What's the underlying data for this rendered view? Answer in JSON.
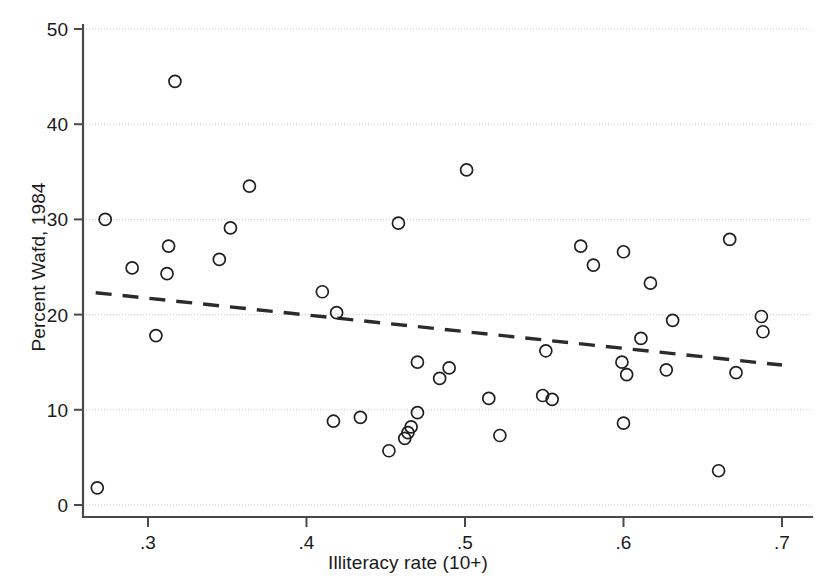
{
  "chart_data": {
    "type": "scatter",
    "title": "",
    "xlabel": "Illiteracy rate (10+)",
    "ylabel": "Percent Wafd, 1984",
    "xlim": [
      0.2595,
      0.7035
    ],
    "ylim": [
      0,
      50
    ],
    "xticks": [
      0.3,
      0.4,
      0.5,
      0.6,
      0.7
    ],
    "xticklabels": [
      ".3",
      ".4",
      ".5",
      ".6",
      ".7"
    ],
    "yticks": [
      0,
      10,
      20,
      30,
      40,
      50
    ],
    "yticklabels": [
      "0",
      "10",
      "20",
      "30",
      "40",
      "50"
    ],
    "grid": "horizontal-dotted",
    "legend": "none",
    "marker": "open-circle",
    "marker_color": "#1f1f1f",
    "marker_radius": 6,
    "points": [
      {
        "x": 0.268,
        "y": 1.8
      },
      {
        "x": 0.273,
        "y": 30.0
      },
      {
        "x": 0.29,
        "y": 24.9
      },
      {
        "x": 0.305,
        "y": 17.8
      },
      {
        "x": 0.312,
        "y": 24.3
      },
      {
        "x": 0.313,
        "y": 27.2
      },
      {
        "x": 0.317,
        "y": 44.5
      },
      {
        "x": 0.345,
        "y": 25.8
      },
      {
        "x": 0.352,
        "y": 29.1
      },
      {
        "x": 0.364,
        "y": 33.5
      },
      {
        "x": 0.41,
        "y": 22.4
      },
      {
        "x": 0.417,
        "y": 8.8
      },
      {
        "x": 0.419,
        "y": 20.2
      },
      {
        "x": 0.434,
        "y": 9.2
      },
      {
        "x": 0.452,
        "y": 5.7
      },
      {
        "x": 0.458,
        "y": 29.6
      },
      {
        "x": 0.462,
        "y": 7.0
      },
      {
        "x": 0.464,
        "y": 7.6
      },
      {
        "x": 0.466,
        "y": 8.2
      },
      {
        "x": 0.47,
        "y": 9.7
      },
      {
        "x": 0.47,
        "y": 15.0
      },
      {
        "x": 0.484,
        "y": 13.3
      },
      {
        "x": 0.49,
        "y": 14.4
      },
      {
        "x": 0.501,
        "y": 35.2
      },
      {
        "x": 0.515,
        "y": 11.2
      },
      {
        "x": 0.522,
        "y": 7.3
      },
      {
        "x": 0.549,
        "y": 11.5
      },
      {
        "x": 0.551,
        "y": 16.2
      },
      {
        "x": 0.555,
        "y": 11.1
      },
      {
        "x": 0.573,
        "y": 27.2
      },
      {
        "x": 0.581,
        "y": 25.2
      },
      {
        "x": 0.599,
        "y": 15.0
      },
      {
        "x": 0.6,
        "y": 8.6
      },
      {
        "x": 0.6,
        "y": 26.6
      },
      {
        "x": 0.602,
        "y": 13.7
      },
      {
        "x": 0.611,
        "y": 17.5
      },
      {
        "x": 0.617,
        "y": 23.3
      },
      {
        "x": 0.627,
        "y": 14.2
      },
      {
        "x": 0.631,
        "y": 19.4
      },
      {
        "x": 0.66,
        "y": 3.6
      },
      {
        "x": 0.667,
        "y": 27.9
      },
      {
        "x": 0.671,
        "y": 13.9
      },
      {
        "x": 0.687,
        "y": 19.8
      },
      {
        "x": 0.688,
        "y": 18.2
      }
    ],
    "fit_line": {
      "style": "dashed",
      "color": "#2b2b2b",
      "x_start": 0.267,
      "y_start": 22.3,
      "x_end": 0.7,
      "y_end": 14.7
    }
  }
}
